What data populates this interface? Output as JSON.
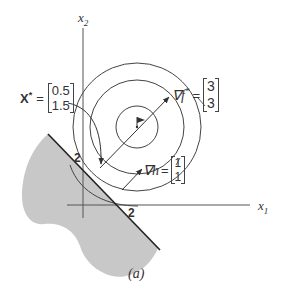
{
  "figure": {
    "caption": "(a)",
    "axes": {
      "x_label": "x",
      "x_sub": "1",
      "y_label": "x",
      "y_sub": "2",
      "tick_x": "2",
      "tick_y": "2"
    },
    "optimum_point": {
      "label": "X",
      "superscript": "*",
      "equals": "=",
      "values": [
        "0.5",
        "1.5"
      ]
    },
    "grad_f": {
      "symbol": "∇f",
      "superscript": "*",
      "equals": "=",
      "values": [
        "3",
        "3"
      ]
    },
    "grad_h": {
      "symbol": "∇h",
      "equals": "=",
      "values": [
        "1",
        "1"
      ]
    },
    "elements": {
      "contours": "concentric circles of objective f centered at flag (unconstrained optimum)",
      "constraint": "line x1 + x2 = 2 with shaded infeasible region",
      "flag_icon": "optimum marker"
    },
    "colors": {
      "line": "#444444",
      "shade": "#c8c8c8",
      "text": "#333333"
    }
  }
}
